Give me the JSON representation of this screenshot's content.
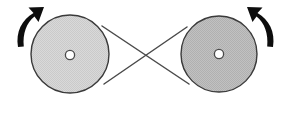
{
  "figure": {
    "background_color": "#ffffff",
    "width": 291,
    "height": 113
  },
  "pulleys": [
    {
      "id": "left-pulley",
      "label": "Left pulley",
      "cx": 70,
      "cy": 54,
      "r": 39,
      "fill_color": "#d6d6d6",
      "outline_color": "#3a3a3a",
      "hub": {
        "cx": 70,
        "cy": 55,
        "r": 4.6,
        "fill_color": "#ffffff"
      }
    },
    {
      "id": "right-pulley",
      "label": "Right pulley",
      "cx": 219,
      "cy": 54,
      "r": 38,
      "fill_color": "#bdbdbd",
      "outline_color": "#3a3a3a",
      "hub": {
        "cx": 219,
        "cy": 54,
        "r": 4.6,
        "fill_color": "#ffffff"
      }
    }
  ],
  "belt": {
    "label": "Crossed drive belt",
    "type": "crossed",
    "color": "#4a4a4a",
    "crossing_point": {
      "x": 146,
      "y": 56
    },
    "segments": [
      {
        "id": "upper-belt",
        "x1": 102,
        "y1": 26,
        "x2": 189,
        "y2": 84
      },
      {
        "id": "lower-belt",
        "x1": 104,
        "y1": 84,
        "x2": 187,
        "y2": 27
      }
    ]
  },
  "arrows": [
    {
      "id": "left-rotation-arrow",
      "label": "Left pulley rotation direction",
      "direction": "up-right",
      "color": "#0d0d0d",
      "path": "M 18 46 C 16 32 22 20 32 14 L 28 9 L 43 8 L 38 22 L 34 17 C 27 23 23 33 24 45 Z"
    },
    {
      "id": "right-rotation-arrow",
      "label": "Right pulley rotation direction",
      "direction": "up-left",
      "color": "#0d0d0d",
      "path": "M 273 46 C 275 32 269 20 259 14 L 263 9 L 248 8 L 253 22 L 257 17 C 264 23 268 33 267 45 Z"
    }
  ]
}
